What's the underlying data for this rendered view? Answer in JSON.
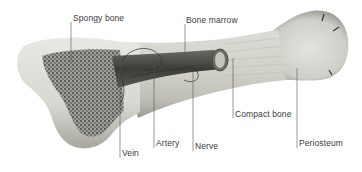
{
  "diagram": {
    "colors": {
      "background": "#ffffff",
      "bone_light": "#e6e6e2",
      "bone_mid": "#c9c9c3",
      "bone_dark": "#8e8e88",
      "spongy": "#5c5c58",
      "marrow": "#3e3e3a",
      "leader": "#555555",
      "label_text": "#3a3a3a"
    },
    "labels": [
      {
        "id": "spongy-bone",
        "text": "Spongy bone",
        "x": 73,
        "y": 13,
        "leader": {
          "x": 71,
          "y1": 22,
          "y2": 62
        }
      },
      {
        "id": "bone-marrow",
        "text": "Bone marrow",
        "x": 186,
        "y": 15,
        "leader": {
          "x": 185,
          "y1": 24,
          "y2": 52
        }
      },
      {
        "id": "vein",
        "text": "Vein",
        "x": 122,
        "y": 148,
        "leader": {
          "x": 120,
          "y1": 58,
          "y2": 158
        }
      },
      {
        "id": "artery",
        "text": "Artery",
        "x": 156,
        "y": 138,
        "leader": {
          "x": 154,
          "y1": 62,
          "y2": 148
        }
      },
      {
        "id": "nerve",
        "text": "Nerve",
        "x": 195,
        "y": 141,
        "leader": {
          "x": 193,
          "y1": 72,
          "y2": 151
        }
      },
      {
        "id": "compact-bone",
        "text": "Compact bone",
        "x": 235,
        "y": 109,
        "leader": {
          "x": 233,
          "y1": 58,
          "y2": 118
        }
      },
      {
        "id": "periosteum",
        "text": "Periosteum",
        "x": 299,
        "y": 138,
        "leader": {
          "x": 297,
          "y1": 68,
          "y2": 148
        }
      }
    ]
  }
}
